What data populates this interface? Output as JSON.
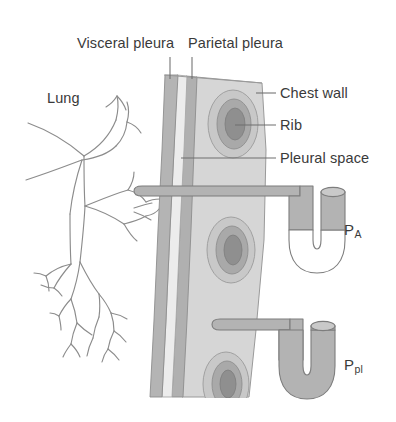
{
  "figure": {
    "labels": {
      "visceral_pleura": "Visceral pleura",
      "parietal_pleura": "Parietal pleura",
      "chest_wall": "Chest wall",
      "rib": "Rib",
      "pleural_space": "Pleural space",
      "lung": "Lung",
      "alveolar_pressure_symbol": "P",
      "alveolar_pressure_subscript": "A",
      "pleural_pressure_symbol": "P",
      "pleural_pressure_subscript": "pl"
    },
    "colors": {
      "background": "#ffffff",
      "text": "#3a3a3a",
      "leader_line": "#6e6e6e",
      "lung_outline": "#8c8c8c",
      "visceral_pleura": "#b4b4b4",
      "pleural_space": "#ececec",
      "parietal_pleura": "#b0b0b0",
      "chest_wall": "#d6d6d6",
      "rib_outer": "#c8c8c8",
      "rib_mid": "#a9a9a9",
      "rib_core": "#8f8f8f",
      "tube_fill": "#b3b3b3",
      "tube_outline": "#7d7d7d",
      "tube_empty": "#ffffff"
    },
    "structures": [
      "lung bronchial tree",
      "visceral pleura layer",
      "pleural space",
      "parietal pleura layer",
      "chest wall with three ribs",
      "alveolar pressure U-tube manometer",
      "pleural pressure U-tube manometer"
    ]
  }
}
